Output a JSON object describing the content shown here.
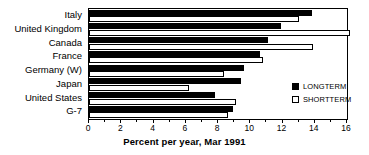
{
  "chart_data": {
    "type": "bar",
    "orientation": "horizontal",
    "title": "",
    "xlabel": "Percent per year, Mar 1991",
    "ylabel": "",
    "xlim": [
      0,
      16
    ],
    "xticks": [
      0,
      2,
      4,
      6,
      8,
      10,
      12,
      14,
      16
    ],
    "xtick_labels": [
      "0",
      "2",
      "4",
      "6",
      "8",
      "10",
      "12",
      "14",
      "16"
    ],
    "minor_tick_step": 1,
    "grid": false,
    "legend_position": "lower-right",
    "categories": [
      "Italy",
      "United Kingdom",
      "Canada",
      "France",
      "Germany (W)",
      "Japan",
      "United States",
      "G-7"
    ],
    "series": [
      {
        "name": "LONGTERM",
        "color": "#000000",
        "values": [
          13.8,
          11.9,
          11.1,
          10.6,
          9.6,
          9.4,
          7.8,
          8.9
        ]
      },
      {
        "name": "SHORTTERM",
        "color": "#ffffff",
        "values": [
          13.0,
          16.2,
          13.9,
          10.8,
          8.4,
          6.2,
          9.1,
          8.6
        ]
      }
    ]
  },
  "legend": {
    "entries": [
      {
        "label": "LONGTERM",
        "swatch": "filled"
      },
      {
        "label": "SHORTTERM",
        "swatch": "hollow"
      }
    ]
  }
}
